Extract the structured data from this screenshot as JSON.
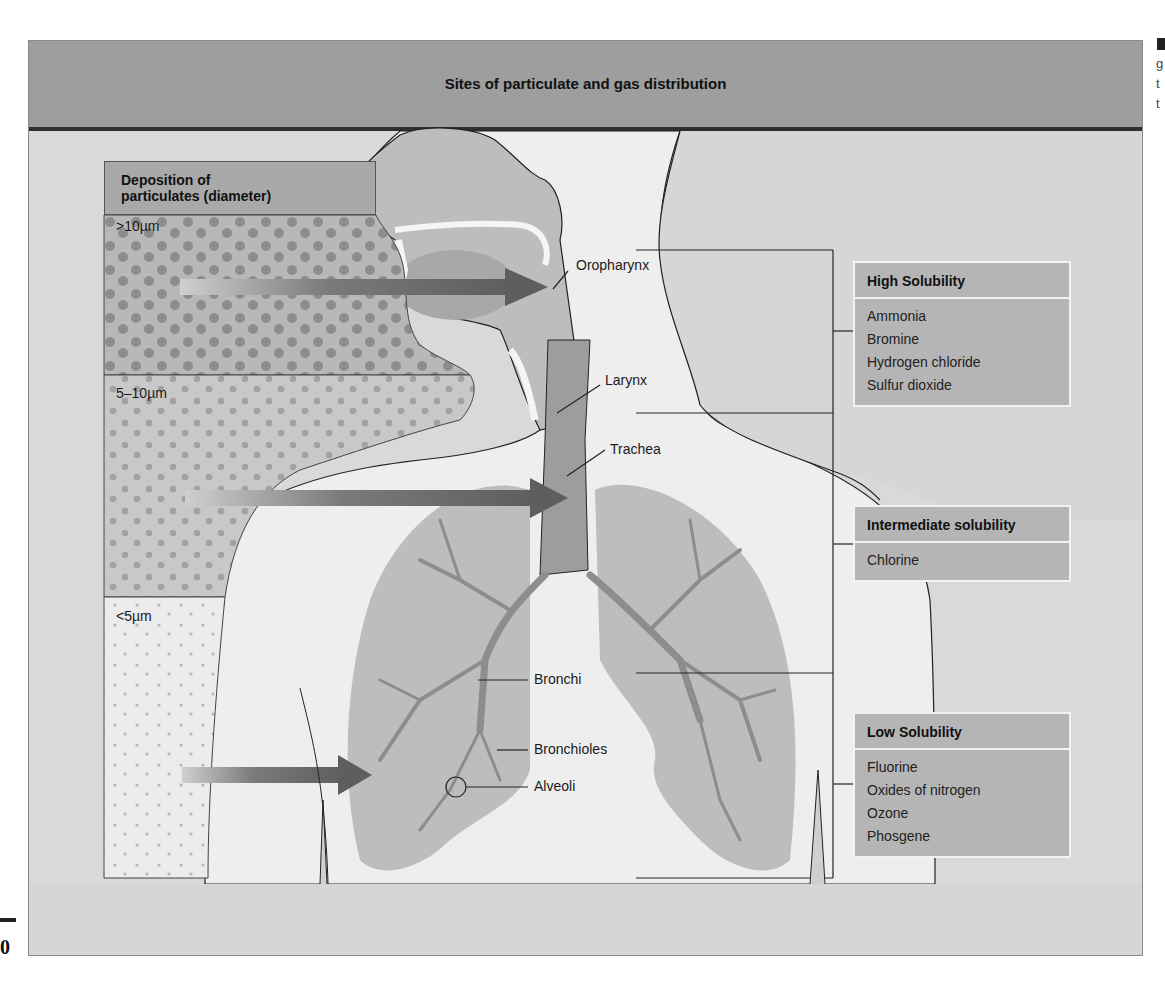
{
  "figure": {
    "title": "Sites of particulate and gas distribution"
  },
  "deposition": {
    "heading_line1": "Deposition of",
    "heading_line2": "particulates (diameter)",
    "bands": [
      {
        "label": ">10µm"
      },
      {
        "label": "5–10µm"
      },
      {
        "label": "<5µm"
      }
    ]
  },
  "anatomy_labels": {
    "oropharynx": "Oropharynx",
    "larynx": "Larynx",
    "trachea": "Trachea",
    "bronchi": "Bronchi",
    "bronchioles": "Bronchioles",
    "alveoli": "Alveoli"
  },
  "solubility": [
    {
      "title": "High Solubility",
      "items": [
        "Ammonia",
        "Bromine",
        "Hydrogen chloride",
        "Sulfur dioxide"
      ]
    },
    {
      "title": "Intermediate solubility",
      "items": [
        "Chlorine"
      ]
    },
    {
      "title": "Low Solubility",
      "items": [
        "Fluorine",
        "Oxides of nitrogen",
        "Ozone",
        "Phosgene"
      ]
    }
  ],
  "margin": {
    "right_fragments": [
      "g",
      "t",
      "t"
    ],
    "left_page_fragment": "0"
  },
  "colors": {
    "header": "#9e9e9e",
    "rule": "#2e2e2e",
    "panel_bg": "#dcdcdc",
    "body_fill": "#eeeeee",
    "lung_fill": "#bdbdbd",
    "arrow": "#6e6e6e",
    "box_fill": "#b5b5b5"
  }
}
